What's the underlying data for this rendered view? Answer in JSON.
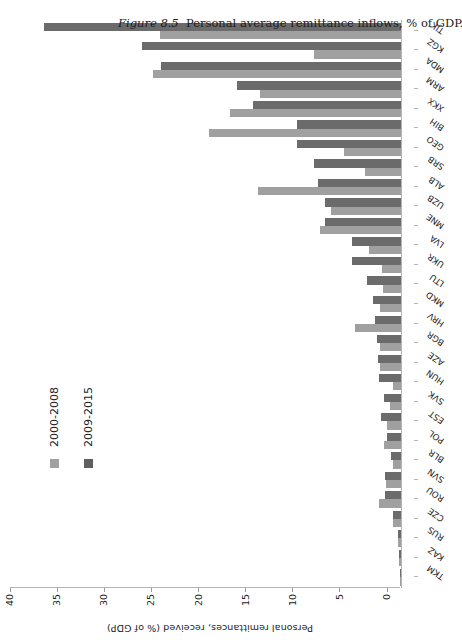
{
  "figure": {
    "caption_prefix": "Figure 8.5",
    "caption_text": "Personal average remittance inflows, % of GDP."
  },
  "chart_data": {
    "type": "bar",
    "orientation": "vertical-bars-on-rotated-page",
    "title": "",
    "xlabel": "",
    "ylabel": "Personal remittances, received (% of GDP)",
    "ylim": [
      0,
      40
    ],
    "yticks": [
      0,
      5,
      10,
      15,
      20,
      25,
      30,
      35,
      40
    ],
    "grid": false,
    "legend_position": "inside-left",
    "categories": [
      "TKM",
      "KAZ",
      "RUS",
      "CZE",
      "ROU",
      "SVN",
      "BLR",
      "POL",
      "EST",
      "SVK",
      "HUN",
      "AZE",
      "BGR",
      "HRV",
      "MKD",
      "LTU",
      "UKR",
      "LVA",
      "MNE",
      "UZB",
      "ALB",
      "SRB",
      "GEO",
      "BIH",
      "XKX",
      "ARM",
      "MDA",
      "KGZ",
      "TJK"
    ],
    "series": [
      {
        "name": "2000-2008",
        "color": "#a0a0a0",
        "values": [
          0.1,
          0.2,
          0.3,
          0.9,
          2.3,
          1.6,
          0.9,
          1.8,
          1.5,
          1.2,
          0.8,
          2.2,
          2.2,
          4.9,
          2.2,
          1.9,
          2.0,
          3.4,
          8.6,
          7.4,
          15.2,
          3.8,
          6.1,
          20.4,
          18.1,
          15.0,
          26.3,
          9.2,
          25.6
        ]
      },
      {
        "name": "2009-2015",
        "color": "#6b6b6b",
        "values": [
          0.1,
          0.2,
          0.3,
          0.9,
          1.7,
          1.7,
          1.1,
          1.5,
          2.1,
          1.8,
          2.3,
          2.4,
          2.6,
          2.8,
          3.0,
          3.6,
          5.2,
          5.2,
          8.1,
          8.1,
          8.8,
          9.2,
          11.0,
          11.0,
          15.7,
          17.4,
          25.5,
          27.5,
          37.9
        ]
      }
    ],
    "series_labels": [
      "2000-2008",
      "2009-2015"
    ]
  }
}
